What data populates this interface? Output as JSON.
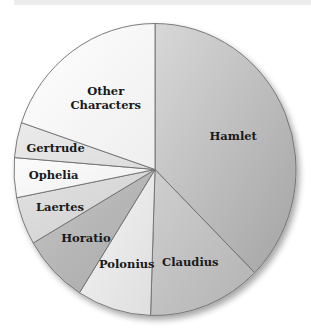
{
  "chart_data": {
    "type": "pie",
    "title": "",
    "start_angle_deg": 90,
    "direction": "clockwise",
    "slices": [
      {
        "label": "Hamlet",
        "value": 37.5,
        "color_from": "#d8d8d8",
        "color_to": "#a4a4a4",
        "label_lines": [
          "Hamlet"
        ]
      },
      {
        "label": "Claudius",
        "value": 13.0,
        "color_from": "#cfcfcf",
        "color_to": "#b3b3b3",
        "label_lines": [
          "Claudius"
        ]
      },
      {
        "label": "Polonius",
        "value": 8.5,
        "color_from": "#f4f4f4",
        "color_to": "#dedede",
        "label_lines": [
          "Polonius"
        ]
      },
      {
        "label": "Horatio",
        "value": 7.6,
        "color_from": "#c4c4c4",
        "color_to": "#a8a8a8",
        "label_lines": [
          "Horatio"
        ]
      },
      {
        "label": "Laertes",
        "value": 5.3,
        "color_from": "#e2e2e2",
        "color_to": "#cfcfcf",
        "label_lines": [
          "Laertes"
        ]
      },
      {
        "label": "Ophelia",
        "value": 4.4,
        "color_from": "#fbfbfb",
        "color_to": "#f0f0f0",
        "label_lines": [
          "Ophelia"
        ]
      },
      {
        "label": "Gertrude",
        "value": 3.9,
        "color_from": "#ebebeb",
        "color_to": "#dcdcdc",
        "label_lines": [
          "Gertrude"
        ]
      },
      {
        "label": "Other Characters",
        "value": 19.8,
        "color_from": "#ffffff",
        "color_to": "#eeeeee",
        "label_lines": [
          "Other",
          "Characters"
        ]
      }
    ],
    "legend": "none",
    "label_position": "inside"
  },
  "layout": {
    "center_x": 155,
    "center_y": 169.5,
    "radius_x": 141,
    "radius_y": 146,
    "stroke": "#6e6e6e"
  }
}
